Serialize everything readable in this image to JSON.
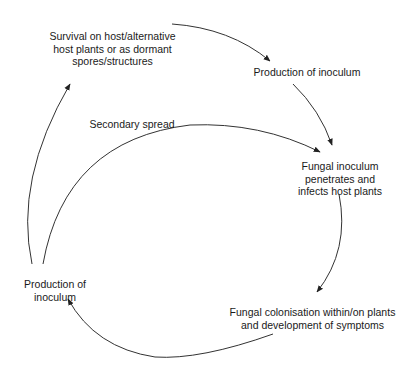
{
  "diagram": {
    "type": "disease-cycle",
    "nodes": {
      "survival": {
        "lines": [
          "Survival on host/alternative",
          "host plants or as dormant",
          "spores/structures"
        ]
      },
      "production_top": {
        "lines": [
          "Production of inoculum"
        ]
      },
      "penetrates": {
        "lines": [
          "Fungal inoculum",
          "penetrates and",
          "infects host plants"
        ]
      },
      "colonisation": {
        "lines": [
          "Fungal colonisation within/on plants",
          "and development of symptoms"
        ]
      },
      "production_left": {
        "lines": [
          "Production of",
          "inoculum"
        ]
      }
    },
    "edge_labels": {
      "secondary_spread": "Secondary spread"
    },
    "edges": [
      {
        "from": "survival",
        "to": "production_top"
      },
      {
        "from": "production_top",
        "to": "penetrates"
      },
      {
        "from": "penetrates",
        "to": "colonisation"
      },
      {
        "from": "colonisation",
        "to": "production_left"
      },
      {
        "from": "production_left",
        "to": "survival"
      },
      {
        "from": "production_left",
        "to": "penetrates",
        "label": "Secondary spread"
      }
    ],
    "colors": {
      "line": "#333333",
      "text": "#1a1a1a",
      "background": "#ffffff"
    }
  }
}
